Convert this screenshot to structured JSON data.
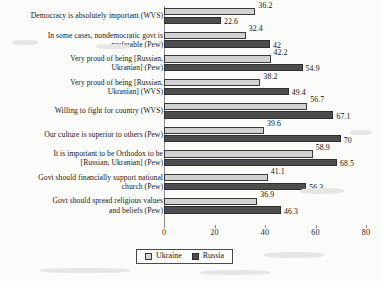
{
  "chart_data": {
    "type": "bar",
    "orientation": "horizontal",
    "title": "",
    "xlabel": "",
    "ylabel": "",
    "xlim": [
      0,
      80
    ],
    "xticks": [
      0,
      20,
      40,
      60,
      80
    ],
    "grid": false,
    "legend_position": "bottom-center",
    "categories": [
      "Democracy is absolutely important (WVS)",
      "In some cases, nondemocratic govt is\npreferable (Pew)",
      "Very proud of being [Russian,\nUkranian] (Pew)",
      "Very proud of being [Russian,\nUkranian] (WVS)",
      "Willing to fight for country (WVS)",
      "Our culture is superior to others (Pew)",
      "It is important to be Orthodox to be\n[Russian, Ukranian] (Pew)",
      "Govt should financially support national\nchurch (Pew)",
      "Govt should spread religious values\nand beliefs (Pew)"
    ],
    "series": [
      {
        "name": "Ukraine",
        "color": "#d2d2d2",
        "values": [
          36.2,
          32.4,
          42.2,
          38.2,
          56.7,
          39.6,
          58.9,
          41.1,
          36.9
        ],
        "labels": [
          "36.2",
          "32.4",
          "42.2",
          "38.2",
          "56.7",
          "39.6",
          "58.9",
          "41.1",
          "36.9"
        ]
      },
      {
        "name": "Russia",
        "color": "#4d4d4d",
        "values": [
          22.6,
          42,
          54.9,
          49.4,
          67.1,
          70,
          68.5,
          56.3,
          46.3
        ],
        "labels": [
          "22.6",
          "42",
          "54.9",
          "49.4",
          "67.1",
          "70",
          "68.5",
          "56.3",
          "46.3"
        ]
      }
    ]
  },
  "legend": {
    "items": [
      {
        "label": "Ukraine",
        "color": "#d2d2d2"
      },
      {
        "label": "Russia",
        "color": "#4d4d4d"
      }
    ]
  },
  "axis": {
    "tick_labels": [
      "0",
      "20",
      "40",
      "60",
      "80"
    ]
  }
}
